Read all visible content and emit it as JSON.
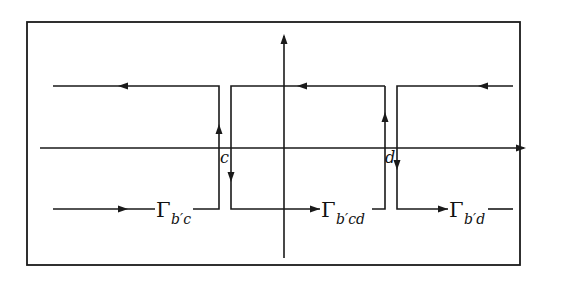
{
  "diagram": {
    "axes": {
      "horizontal": {
        "direction": "right"
      },
      "vertical": {
        "direction": "up"
      }
    },
    "points": {
      "c": "c",
      "d": "d"
    },
    "contours": [
      {
        "id": "b-prime-c",
        "symbol": "Γ",
        "subscript": "b′c"
      },
      {
        "id": "b-prime-cd",
        "symbol": "Γ",
        "subscript": "b′cd"
      },
      {
        "id": "b-prime-d",
        "symbol": "Γ",
        "subscript": "b′d"
      }
    ],
    "colors": {
      "stroke": "#1a1a1a",
      "background": "#ffffff"
    }
  }
}
